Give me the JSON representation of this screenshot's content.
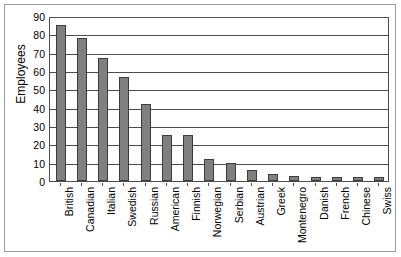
{
  "chart_data": {
    "type": "bar",
    "title": "",
    "xlabel": "",
    "ylabel": "Employees",
    "ylim": [
      0,
      90
    ],
    "yticks": [
      0,
      10,
      20,
      30,
      40,
      50,
      60,
      70,
      80,
      90
    ],
    "grid": true,
    "legend": false,
    "bar_color": "#808080",
    "bar_border_color": "#3d3d3d",
    "axis_color": "#4d4d4d",
    "categories": [
      "British",
      "Canadian",
      "Italian",
      "Swedish",
      "Russian",
      "American",
      "Finnish",
      "Norwegian",
      "Serbian",
      "Austrian",
      "Greek",
      "Montenegro",
      "Danish",
      "French",
      "Chinese",
      "Swiss"
    ],
    "values": [
      85,
      78,
      67,
      57,
      42,
      25,
      25,
      12,
      10,
      6,
      4,
      3,
      2,
      2,
      2,
      2
    ]
  }
}
